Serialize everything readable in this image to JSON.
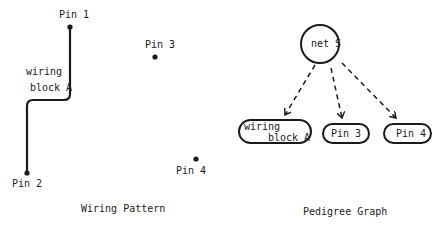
{
  "wiring_pattern": {
    "caption": "Wiring Pattern",
    "wire_label_line1": "wiring",
    "wire_label_line2": "block A",
    "pins": [
      {
        "label": "Pin 1"
      },
      {
        "label": "Pin 2"
      },
      {
        "label": "Pin 3"
      },
      {
        "label": "Pin 4"
      }
    ]
  },
  "pedigree_graph": {
    "caption": "Pedigree Graph",
    "root": {
      "label": "net S"
    },
    "children": [
      {
        "label_line1": "wiring",
        "label_line2": "block A"
      },
      {
        "label": "Pin 3"
      },
      {
        "label": "Pin 4"
      }
    ]
  },
  "colors": {
    "ink": "#1a1a1a",
    "background": "#ffffff"
  }
}
